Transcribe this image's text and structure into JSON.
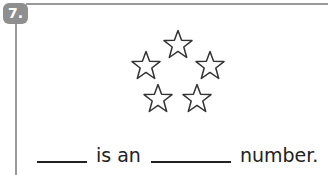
{
  "question": {
    "number": "7.",
    "badge_color": "#8f8f8f",
    "star_count": 5,
    "sentence": {
      "part1": "is an",
      "part2": "number."
    }
  }
}
